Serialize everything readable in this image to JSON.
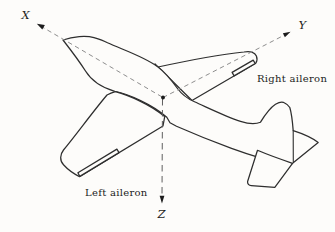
{
  "figure": {
    "type": "aircraft-body-axes-diagram",
    "axes": {
      "x": "X",
      "y": "Y",
      "z": "Z"
    },
    "labels": {
      "right_aileron": "Right aileron",
      "left_aileron": "Left aileron"
    },
    "colors": {
      "outline": "#2e2e2e",
      "axis_xy": "#8e8e8e",
      "axis_z": "#5f5f5f",
      "marker": "#1c1c1c",
      "paper": "#fdfcfa",
      "text": "#1c1c1c"
    }
  }
}
